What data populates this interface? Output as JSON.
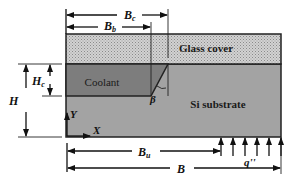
{
  "diagram": {
    "type": "cross-section schematic",
    "regions": {
      "glass_cover": {
        "label": "Glass cover",
        "fill": "#c9c9c9"
      },
      "coolant": {
        "label": "Coolant",
        "fill": "#7d7d7d"
      },
      "substrate": {
        "label": "Si substrate",
        "fill": "#a3a3a3"
      }
    },
    "dimensions": {
      "Bc": {
        "main": "B",
        "sub": "c"
      },
      "Bb": {
        "main": "B",
        "sub": "b"
      },
      "Hc": {
        "main": "H",
        "sub": "c"
      },
      "H": {
        "main": "H"
      },
      "Bu": {
        "main": "B",
        "sub": "u"
      },
      "B": {
        "main": "B"
      }
    },
    "angle": {
      "label": "β"
    },
    "axes": {
      "x": "X",
      "y": "Y"
    },
    "heat_flux": {
      "label": "q''",
      "arrow_count": 6
    }
  }
}
